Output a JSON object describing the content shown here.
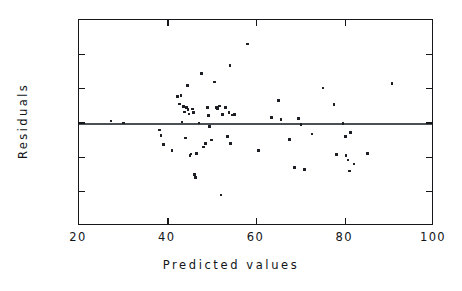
{
  "chart_data": {
    "type": "scatter",
    "title": "",
    "xlabel": "Predicted values",
    "ylabel": "Residuals",
    "xlim": [
      20,
      100
    ],
    "ylim": [
      -30,
      30
    ],
    "xticks": [
      20,
      40,
      60,
      80,
      100
    ],
    "yticks": [
      30,
      20,
      10,
      0,
      -10,
      -20,
      -30
    ],
    "xtick_labels": [
      "20",
      "40",
      "60",
      "80",
      "100"
    ],
    "ytick_labels": [
      "30",
      "20",
      "10",
      "0",
      "- 10",
      "- 20",
      "- 30"
    ],
    "grid": false,
    "legend": false,
    "reference_line": {
      "y": 0,
      "style": "solid"
    },
    "marker": "square",
    "marker_color": "#1a1d21",
    "points": [
      [
        27.2,
        0.6
      ],
      [
        30.0,
        0.0
      ],
      [
        38.2,
        -2.0
      ],
      [
        38.5,
        -3.7
      ],
      [
        39.0,
        -6.3
      ],
      [
        41.0,
        -8.0
      ],
      [
        42.2,
        7.7
      ],
      [
        42.6,
        5.5
      ],
      [
        43.0,
        8.0
      ],
      [
        43.2,
        0.3
      ],
      [
        43.5,
        4.8
      ],
      [
        43.8,
        3.2
      ],
      [
        44.0,
        -4.4
      ],
      [
        44.2,
        4.5
      ],
      [
        44.5,
        11.0
      ],
      [
        44.6,
        4.0
      ],
      [
        44.8,
        2.6
      ],
      [
        45.0,
        -9.5
      ],
      [
        45.2,
        -9.0
      ],
      [
        45.6,
        4.1
      ],
      [
        45.8,
        3.1
      ],
      [
        46.0,
        -15.0
      ],
      [
        46.2,
        -15.8
      ],
      [
        46.5,
        -8.8
      ],
      [
        47.0,
        0.0
      ],
      [
        47.6,
        14.5
      ],
      [
        48.0,
        -7.0
      ],
      [
        48.5,
        -6.0
      ],
      [
        49.0,
        4.5
      ],
      [
        49.2,
        2.2
      ],
      [
        49.4,
        -1.0
      ],
      [
        49.8,
        -5.0
      ],
      [
        50.5,
        12.0
      ],
      [
        51.0,
        4.6
      ],
      [
        51.2,
        4.3
      ],
      [
        51.6,
        5.0
      ],
      [
        52.0,
        -21.0
      ],
      [
        52.4,
        2.4
      ],
      [
        53.0,
        4.6
      ],
      [
        53.4,
        -4.0
      ],
      [
        53.8,
        3.0
      ],
      [
        54.0,
        16.8
      ],
      [
        54.2,
        -6.0
      ],
      [
        54.6,
        2.3
      ],
      [
        55.0,
        2.5
      ],
      [
        58.0,
        23.0
      ],
      [
        60.5,
        -8.0
      ],
      [
        63.4,
        1.6
      ],
      [
        65.0,
        6.5
      ],
      [
        65.5,
        1.0
      ],
      [
        67.5,
        -4.8
      ],
      [
        68.5,
        -13.0
      ],
      [
        69.4,
        1.3
      ],
      [
        70.0,
        -0.5
      ],
      [
        70.8,
        -13.5
      ],
      [
        72.5,
        -3.2
      ],
      [
        75.0,
        10.2
      ],
      [
        77.5,
        5.4
      ],
      [
        78.0,
        -9.2
      ],
      [
        79.5,
        -0.1
      ],
      [
        80.0,
        -4.0
      ],
      [
        80.2,
        -9.5
      ],
      [
        80.6,
        -10.8
      ],
      [
        81.0,
        -14.0
      ],
      [
        81.2,
        -2.8
      ],
      [
        82.0,
        -12.0
      ],
      [
        85.0,
        -8.8
      ],
      [
        90.5,
        11.5
      ]
    ]
  },
  "axis": {
    "y_title": "Residuals",
    "x_title": "Predicted values"
  }
}
